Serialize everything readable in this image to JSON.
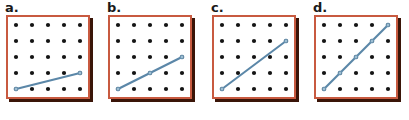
{
  "figure": {
    "name": "geoboard-slope-comparison",
    "background_color": "#ffffff",
    "width": 409,
    "height": 120
  },
  "style": {
    "border_color": "#c85a40",
    "shadow_color": "#3a1508",
    "board_fill": "#ffffff",
    "peg_color": "#141414",
    "line_color": "#5b87a8",
    "node_color": "#9dbed2",
    "label_color": "#1a1a1a"
  },
  "grid": {
    "rows": 5,
    "cols": 5,
    "spacing": 16,
    "margin": 8,
    "peg_radius": 2.1
  },
  "panels": [
    {
      "id": "panel-a",
      "label": "a.",
      "left": 0,
      "segment": {
        "start": {
          "col": 0,
          "row": 4
        },
        "end": {
          "col": 4,
          "row": 3
        },
        "rise": 1,
        "run": 4,
        "slope": "1/4"
      },
      "nodes": [
        {
          "col": 0,
          "row": 4
        },
        {
          "col": 4,
          "row": 3
        }
      ]
    },
    {
      "id": "panel-b",
      "label": "b.",
      "left": 102,
      "segment": {
        "start": {
          "col": 0,
          "row": 4
        },
        "end": {
          "col": 4,
          "row": 2
        },
        "rise": 2,
        "run": 4,
        "slope": "1/2"
      },
      "nodes": [
        {
          "col": 0,
          "row": 4
        },
        {
          "col": 2,
          "row": 3
        },
        {
          "col": 4,
          "row": 2
        }
      ]
    },
    {
      "id": "panel-c",
      "label": "c.",
      "left": 206,
      "segment": {
        "start": {
          "col": 0,
          "row": 4
        },
        "end": {
          "col": 4,
          "row": 1
        },
        "rise": 3,
        "run": 4,
        "slope": "3/4"
      },
      "nodes": [
        {
          "col": 0,
          "row": 4
        },
        {
          "col": 4,
          "row": 1
        }
      ]
    },
    {
      "id": "panel-d",
      "label": "d.",
      "left": 308,
      "segment": {
        "start": {
          "col": 0,
          "row": 4
        },
        "end": {
          "col": 4,
          "row": 0
        },
        "rise": 4,
        "run": 4,
        "slope": "1"
      },
      "nodes": [
        {
          "col": 0,
          "row": 4
        },
        {
          "col": 1,
          "row": 3
        },
        {
          "col": 2,
          "row": 2
        },
        {
          "col": 3,
          "row": 1
        },
        {
          "col": 4,
          "row": 0
        }
      ]
    }
  ]
}
